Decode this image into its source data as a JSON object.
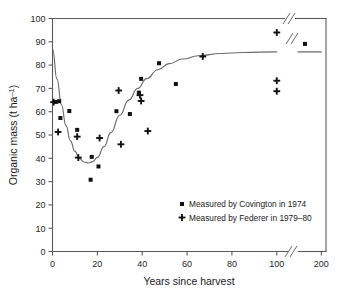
{
  "chart_data": {
    "type": "scatter",
    "title": "",
    "xlabel": "Years since harvest",
    "ylabel": "Organic mass (t ha⁻¹)",
    "xlim": [
      0,
      210
    ],
    "ylim": [
      0,
      100
    ],
    "grid": false,
    "x_ticks": [
      0,
      20,
      40,
      60,
      80,
      100,
      200
    ],
    "x_tick_labels": [
      "0",
      "20",
      "40",
      "60",
      "80",
      "100",
      "200"
    ],
    "y_ticks": [
      0,
      10,
      20,
      30,
      40,
      50,
      60,
      70,
      80,
      90,
      100
    ],
    "y_tick_labels": [
      "0",
      "10",
      "20",
      "30",
      "40",
      "50",
      "60",
      "70",
      "80",
      "90",
      "100"
    ],
    "axis_break": {
      "present": true,
      "axis": "x",
      "between": [
        105,
        150
      ],
      "symbol": "//"
    },
    "legend_position": "inside-lower-right",
    "series": [
      {
        "name": "Measured by Covington in 1974",
        "marker": "square",
        "color": "#111111",
        "points": [
          {
            "x": 1.5,
            "y": 64.2
          },
          {
            "x": 3.0,
            "y": 64.5
          },
          {
            "x": 3.5,
            "y": 57.3
          },
          {
            "x": 7.5,
            "y": 60.3
          },
          {
            "x": 11.0,
            "y": 52.2
          },
          {
            "x": 17.5,
            "y": 40.6
          },
          {
            "x": 17.0,
            "y": 30.8
          },
          {
            "x": 20.5,
            "y": 36.5
          },
          {
            "x": 28.5,
            "y": 60.2
          },
          {
            "x": 34.5,
            "y": 59.0
          },
          {
            "x": 38.5,
            "y": 68.2
          },
          {
            "x": 39.5,
            "y": 74.1
          },
          {
            "x": 47.5,
            "y": 80.8
          },
          {
            "x": 55.0,
            "y": 71.9
          },
          {
            "x": 165.0,
            "y": 89.1
          }
        ]
      },
      {
        "name": "Measured by Federer in 1979–80",
        "marker": "plus",
        "color": "#111111",
        "points": [
          {
            "x": 0.5,
            "y": 64.1
          },
          {
            "x": 2.5,
            "y": 51.3
          },
          {
            "x": 11.0,
            "y": 49.3
          },
          {
            "x": 11.5,
            "y": 40.3
          },
          {
            "x": 21.0,
            "y": 48.7
          },
          {
            "x": 29.5,
            "y": 69.1
          },
          {
            "x": 30.5,
            "y": 46.0
          },
          {
            "x": 39.0,
            "y": 67.1
          },
          {
            "x": 39.5,
            "y": 64.6
          },
          {
            "x": 42.5,
            "y": 51.7
          },
          {
            "x": 67.0,
            "y": 83.7
          },
          {
            "x": 100.0,
            "y": 94.0
          },
          {
            "x": 100.0,
            "y": 73.3
          },
          {
            "x": 100.0,
            "y": 68.8
          }
        ]
      }
    ],
    "fit_curve": {
      "name": "fitted organic mass trend",
      "description": "Sharp decline from 87 t/ha at harvest to minimum near 38 t/ha at ~16 years, then recovery to a plateau near 86 t/ha",
      "start": {
        "x": 0,
        "y": 87.0
      },
      "minimum": {
        "x": 16,
        "y": 38.0
      },
      "plateau": {
        "x": 200,
        "y": 85.7
      },
      "points": [
        {
          "x": 0,
          "y": 87.0
        },
        {
          "x": 2,
          "y": 74.0
        },
        {
          "x": 4,
          "y": 63.0
        },
        {
          "x": 6,
          "y": 54.0
        },
        {
          "x": 8,
          "y": 47.5
        },
        {
          "x": 10,
          "y": 43.0
        },
        {
          "x": 12,
          "y": 40.0
        },
        {
          "x": 14,
          "y": 38.4
        },
        {
          "x": 16,
          "y": 38.0
        },
        {
          "x": 18,
          "y": 38.6
        },
        {
          "x": 20,
          "y": 40.4
        },
        {
          "x": 23,
          "y": 45.0
        },
        {
          "x": 26,
          "y": 51.0
        },
        {
          "x": 30,
          "y": 58.5
        },
        {
          "x": 34,
          "y": 65.0
        },
        {
          "x": 38,
          "y": 70.0
        },
        {
          "x": 42,
          "y": 74.2
        },
        {
          "x": 47,
          "y": 78.0
        },
        {
          "x": 52,
          "y": 80.6
        },
        {
          "x": 58,
          "y": 82.6
        },
        {
          "x": 65,
          "y": 84.0
        },
        {
          "x": 75,
          "y": 85.0
        },
        {
          "x": 85,
          "y": 85.4
        },
        {
          "x": 100,
          "y": 85.7
        },
        {
          "x": 200,
          "y": 85.7
        }
      ]
    }
  },
  "legend": {
    "entries": [
      {
        "label": "Measured by Covington in 1974",
        "marker": "square-marker"
      },
      {
        "label": "Measured by Federer in 1979–80",
        "marker": "plus-marker"
      }
    ]
  },
  "axes": {
    "x_title": "Years since harvest",
    "y_title": "Organic mass (t ha⁻¹)",
    "y_label_main": "Organic mass (t ha",
    "y_label_sup": "–1",
    "y_label_tail": ")"
  }
}
